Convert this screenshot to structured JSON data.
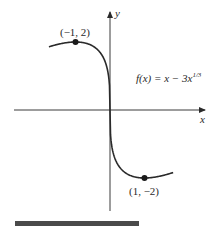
{
  "chart_data": {
    "type": "line",
    "title": "",
    "function": "f(x) = x - 3x^(1/3)",
    "annotation": {
      "label_prefix": "f(x) = x − 3x",
      "label_exponent": "1/3"
    },
    "xlabel": "x",
    "ylabel": "y",
    "xlim": [
      -1.77,
      1.83
    ],
    "ylim": [
      -2.9,
      2.9
    ],
    "grid": false,
    "legend": "none",
    "x": [
      -1.77,
      -1.6,
      -1.4,
      -1.2,
      -1.0,
      -0.8,
      -0.6,
      -0.4,
      -0.2,
      -0.05,
      0,
      0.05,
      0.2,
      0.4,
      0.6,
      0.8,
      1.0,
      1.2,
      1.4,
      1.6,
      1.83
    ],
    "y": [
      1.65,
      1.91,
      1.96,
      1.99,
      2.0,
      1.99,
      1.93,
      1.81,
      1.55,
      1.06,
      0,
      -1.06,
      -1.55,
      -1.81,
      -1.93,
      -1.99,
      -2.0,
      -1.99,
      -1.96,
      -1.91,
      -1.8
    ],
    "points": [
      {
        "x": -1,
        "y": 2,
        "label": "(−1, 2)"
      },
      {
        "x": 1,
        "y": -2,
        "label": "(1, −2)"
      }
    ],
    "colors": {
      "curve": "#2a2a2a",
      "axes": "#3a3a3a",
      "bar": "#4a4a4a"
    }
  }
}
